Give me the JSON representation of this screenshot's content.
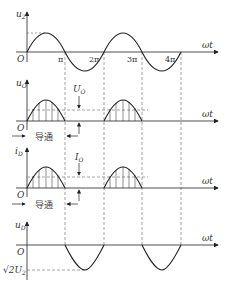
{
  "panels": [
    {
      "id": "u2",
      "ylabel": "u",
      "ysub": "2",
      "xlabel": "ωt",
      "origin": "O",
      "ticks": [
        "π",
        "2π",
        "3π",
        "4π"
      ]
    },
    {
      "id": "uO",
      "ylabel": "u",
      "ysub": "O",
      "xlabel": "ωt",
      "origin": "O",
      "avg_label": "U",
      "avg_sub": "O",
      "conduct_label": "导通"
    },
    {
      "id": "iD",
      "ylabel": "i",
      "ysub": "D",
      "xlabel": "ωt",
      "origin": "O",
      "avg_label": "I",
      "avg_sub": "O",
      "conduct_label": "导通"
    },
    {
      "id": "uD",
      "ylabel": "u",
      "ysub": "D",
      "xlabel": "ωt",
      "origin": "O",
      "peak_label": "√2U",
      "peak_sub": "2"
    }
  ],
  "colors": {
    "stroke": "#222222",
    "dash": "#555555"
  }
}
